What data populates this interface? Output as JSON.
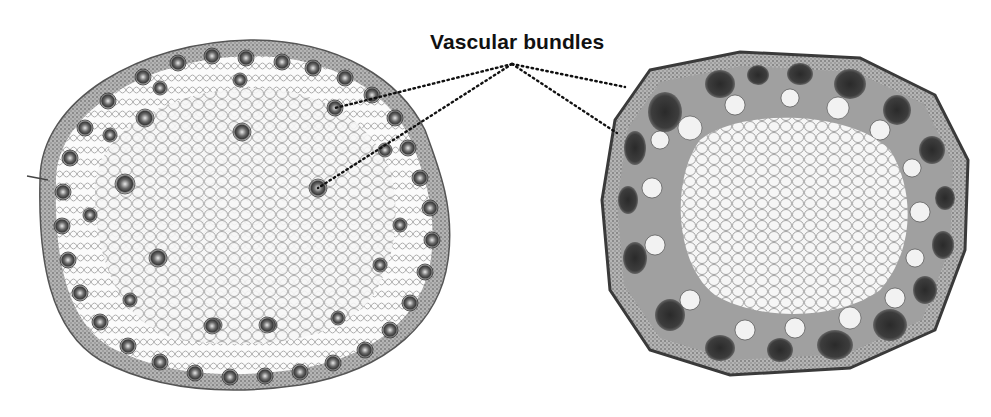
{
  "diagram": {
    "title": "Vascular bundles",
    "label": "Vascular bundles",
    "figures": [
      {
        "id": "monocot-stem",
        "description": "Cross-section of monocot stem with scattered vascular bundles",
        "shape": "round"
      },
      {
        "id": "dicot-stem",
        "description": "Cross-section of dicot stem with vascular bundles arranged in a ring",
        "shape": "octagonal"
      }
    ],
    "leader_lines": [
      {
        "from": [
          512,
          64
        ],
        "to": [
          335,
          108
        ],
        "target": "monocot-stem"
      },
      {
        "from": [
          512,
          64
        ],
        "to": [
          318,
          188
        ],
        "target": "monocot-stem"
      },
      {
        "from": [
          512,
          64
        ],
        "to": [
          625,
          87
        ],
        "target": "dicot-stem"
      },
      {
        "from": [
          512,
          64
        ],
        "to": [
          617,
          133
        ],
        "target": "dicot-stem"
      }
    ],
    "colors": {
      "ink": "#111111",
      "bundle_dark": "#2a2a2a",
      "tissue": "#f4f4f4",
      "cortex": "#8a8a8a"
    }
  }
}
